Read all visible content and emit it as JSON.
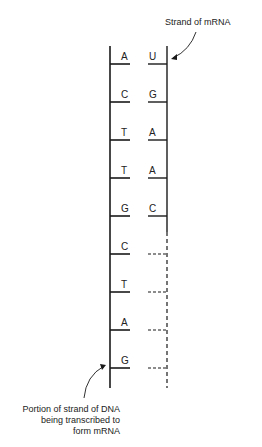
{
  "labels": {
    "mrna": "Strand of mRNA",
    "dna_line1": "Portion of strand of DNA",
    "dna_line2": "being transcribed to",
    "dna_line3": "form mRNA"
  },
  "dna_bases": [
    "A",
    "C",
    "T",
    "T",
    "G",
    "C",
    "T",
    "A",
    "G"
  ],
  "mrna_bases": [
    "U",
    "G",
    "A",
    "A",
    "C",
    "",
    "",
    "",
    ""
  ],
  "colors": {
    "line": "#1a1a1a",
    "text": "#222222",
    "background": "#ffffff"
  }
}
